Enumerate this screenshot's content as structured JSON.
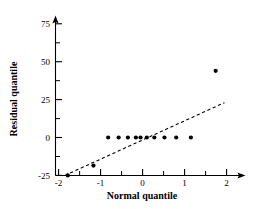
{
  "chart_data": {
    "type": "scatter",
    "title": "",
    "subtitle": "",
    "xlabel": "Normal quantile",
    "ylabel": "Residual quantile",
    "xlim": [
      -2.05,
      2.15
    ],
    "ylim": [
      -25,
      80
    ],
    "grid": false,
    "legend": null,
    "x_ticks": [
      -2,
      -1,
      0,
      1,
      2
    ],
    "x_tick_labels": [
      "-2",
      "-1",
      "0",
      "1",
      "2"
    ],
    "x_minor_ticks": [
      -1.5,
      -0.5,
      0.5,
      1.5
    ],
    "y_ticks": [
      -25,
      0,
      25,
      50,
      75
    ],
    "y_tick_labels": [
      "-25",
      "0",
      "25",
      "50",
      "75"
    ],
    "y_minor_ticks": [
      -12.5,
      12.5,
      37.5,
      62.5
    ],
    "series": [
      {
        "name": "residual quantiles",
        "marker": "filled-circle",
        "color": "#000000",
        "points": [
          {
            "x": -1.78,
            "y": -25.0
          },
          {
            "x": -1.17,
            "y": -18.5
          },
          {
            "x": -0.82,
            "y": 0.0
          },
          {
            "x": -0.57,
            "y": 0.0
          },
          {
            "x": -0.35,
            "y": 0.0
          },
          {
            "x": -0.16,
            "y": 0.0
          },
          {
            "x": -0.05,
            "y": 0.0
          },
          {
            "x": 0.1,
            "y": 0.0
          },
          {
            "x": 0.28,
            "y": 0.0
          },
          {
            "x": 0.52,
            "y": 0.0
          },
          {
            "x": 0.8,
            "y": 0.0
          },
          {
            "x": 1.15,
            "y": 0.0
          },
          {
            "x": 1.74,
            "y": 44.0
          }
        ]
      }
    ],
    "reference_line": {
      "name": "normal reference line",
      "style": "dashed",
      "color": "#000000",
      "x_start": -1.85,
      "y_start": -25.0,
      "x_end": 1.95,
      "y_end": 23.0
    }
  }
}
